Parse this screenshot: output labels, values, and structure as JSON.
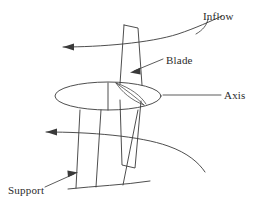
{
  "figure": {
    "background_color": "#ffffff",
    "line_color": "#3a3a3a",
    "text_color": "#2b2b2b",
    "width": 266,
    "height": 210
  },
  "labels": {
    "inflow": "Inflow",
    "blade": "Blade",
    "axis": "Axis",
    "support": "Support"
  },
  "components": {
    "rotor_disk": "ellipse",
    "blade": "tapered-vertical-foil",
    "airfoil_section": "curved-chord",
    "tower": "tapered-support-column",
    "ground": "ground-curve",
    "inflow_streamlines": 2,
    "inflow_arrow_direction": "left"
  }
}
